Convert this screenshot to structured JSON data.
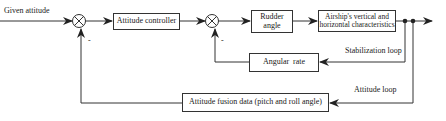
{
  "diagram": {
    "input_label": "Given attitude",
    "blocks": {
      "attitude_controller": "Attitude controller",
      "rudder_angle_line1": "Rudder",
      "rudder_angle_line2": "angle",
      "airship_line1": "Airship's vertical and",
      "airship_line2": "horizontal characteristics",
      "angular_rate": "Angular  rate",
      "attitude_fusion": "Attitude fusion data (pitch and roll angle)"
    },
    "loops": {
      "stabilization": "Stabilization loop",
      "attitude": "Attitude loop"
    },
    "signs": {
      "sum1_minus": "-",
      "sum2_minus": "-"
    },
    "colors": {
      "line": "#333333",
      "background": "#ffffff"
    }
  }
}
